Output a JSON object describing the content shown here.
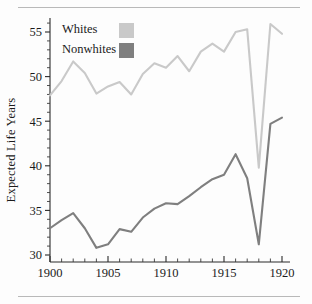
{
  "chart_data": {
    "type": "line",
    "title": "",
    "subtitle": "",
    "xlabel": "",
    "ylabel": "Expected Life Years",
    "xlim": [
      1900,
      1920
    ],
    "ylim": [
      29,
      56.5
    ],
    "grid": false,
    "legend_position": "top-left",
    "x": [
      1900,
      1901,
      1902,
      1903,
      1904,
      1905,
      1906,
      1907,
      1908,
      1909,
      1910,
      1911,
      1912,
      1913,
      1914,
      1915,
      1916,
      1917,
      1918,
      1919,
      1920
    ],
    "xticks": [
      1900,
      1905,
      1910,
      1915,
      1920
    ],
    "xtick_labels": [
      "1900",
      "1905",
      "1910",
      "1915",
      "1920"
    ],
    "x_minor_step": 1,
    "yticks": [
      30,
      35,
      40,
      45,
      50,
      55
    ],
    "ytick_labels": [
      "30",
      "35",
      "40",
      "45",
      "50",
      "55"
    ],
    "y_minor_step": 1,
    "series": [
      {
        "name": "Whites",
        "color": "#c9c9c9",
        "values": [
          47.9,
          49.5,
          51.7,
          50.4,
          48.1,
          48.9,
          49.4,
          48.0,
          50.3,
          51.5,
          51.0,
          52.3,
          50.6,
          52.8,
          53.7,
          52.8,
          55.0,
          55.3,
          39.8,
          55.9,
          54.8
        ]
      },
      {
        "name": "Nonwhites",
        "color": "#7f7f7f",
        "values": [
          33.0,
          33.9,
          34.7,
          33.0,
          30.8,
          31.2,
          32.9,
          32.6,
          34.2,
          35.2,
          35.8,
          35.7,
          36.6,
          37.6,
          38.5,
          39.0,
          41.3,
          38.6,
          31.2,
          44.7,
          45.4
        ]
      }
    ]
  },
  "legend": {
    "items": [
      {
        "label": "Whites",
        "color": "#c9c9c9"
      },
      {
        "label": "Nonwhites",
        "color": "#7f7f7f"
      }
    ]
  },
  "axes": {
    "y_title": "Expected Life Years"
  }
}
